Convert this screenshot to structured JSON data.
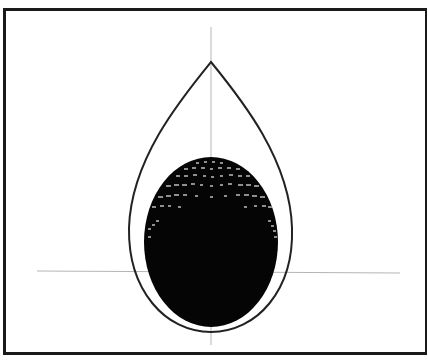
{
  "figure": {
    "colors": {
      "frame": "#1a1a1a",
      "outline": "#222222",
      "axis": "#b5b5b5",
      "fill": "#050505",
      "mesh_dots": "#8a8a8a",
      "background": "#ffffff"
    },
    "axes": {
      "vertical": {
        "x": 211,
        "y1": 27,
        "y2": 345
      },
      "horizontal": {
        "y": 271,
        "x1": 37,
        "x2": 400
      }
    },
    "teardrop": {
      "tip": [
        211,
        62
      ],
      "bottom": [
        211,
        332
      ],
      "left_x": 129,
      "right_x": 292
    },
    "ellipsoid": {
      "cx": 211,
      "cy": 242,
      "rx": 67,
      "ry": 85
    }
  }
}
